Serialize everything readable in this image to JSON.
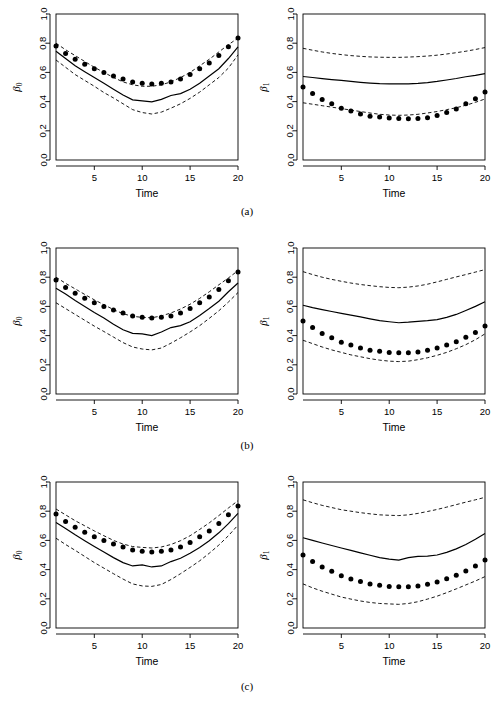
{
  "figure": {
    "rows": [
      {
        "caption": "(a)"
      },
      {
        "caption": "(b)"
      },
      {
        "caption": "(c)"
      }
    ]
  },
  "axis": {
    "xlabel": "Time",
    "xticks": [
      "5",
      "10",
      "15",
      "20"
    ],
    "xtick_values": [
      5,
      10,
      15,
      20
    ],
    "yticks": [
      "0.0",
      "0.2",
      "0.4",
      "0.6",
      "0.8",
      "1.0"
    ],
    "ytick_values": [
      0.0,
      0.2,
      0.4,
      0.6,
      0.8,
      1.0
    ],
    "ylabel_beta0": "β",
    "ylabel_beta0_sub": "0",
    "ylabel_beta1": "β",
    "ylabel_beta1_sub": "1"
  },
  "colors": {
    "line": "#000000",
    "dashed": "#000000",
    "point": "#000000",
    "axis": "#000000",
    "background": "#ffffff"
  },
  "chart_data": [
    {
      "type": "line",
      "panel": "a-beta0",
      "title": "",
      "xlabel": "Time",
      "ylabel": "β₀",
      "xlim": [
        1,
        20
      ],
      "ylim": [
        0.0,
        1.0
      ],
      "grid": false,
      "legend": "none",
      "x": [
        1,
        2,
        3,
        4,
        5,
        6,
        7,
        8,
        9,
        10,
        11,
        12,
        13,
        14,
        15,
        16,
        17,
        18,
        19,
        20
      ],
      "series": [
        {
          "name": "true (points)",
          "style": "points",
          "values": [
            0.78,
            0.73,
            0.69,
            0.655,
            0.625,
            0.6,
            0.575,
            0.555,
            0.535,
            0.525,
            0.52,
            0.525,
            0.535,
            0.555,
            0.585,
            0.625,
            0.665,
            0.715,
            0.775,
            0.835
          ]
        },
        {
          "name": "estimate (solid)",
          "style": "solid",
          "values": [
            0.745,
            0.695,
            0.645,
            0.605,
            0.565,
            0.525,
            0.485,
            0.445,
            0.412,
            0.405,
            0.398,
            0.415,
            0.442,
            0.455,
            0.485,
            0.525,
            0.575,
            0.625,
            0.695,
            0.775
          ]
        },
        {
          "name": "upper band (dashed)",
          "style": "dashed",
          "values": [
            0.8,
            0.755,
            0.715,
            0.675,
            0.635,
            0.6,
            0.565,
            0.535,
            0.515,
            0.505,
            0.505,
            0.515,
            0.535,
            0.565,
            0.6,
            0.645,
            0.69,
            0.74,
            0.79,
            0.835
          ]
        },
        {
          "name": "lower band (dashed)",
          "style": "dashed",
          "values": [
            0.685,
            0.635,
            0.585,
            0.545,
            0.505,
            0.462,
            0.425,
            0.385,
            0.345,
            0.325,
            0.315,
            0.328,
            0.355,
            0.385,
            0.422,
            0.465,
            0.515,
            0.565,
            0.63,
            0.72
          ]
        }
      ]
    },
    {
      "type": "line",
      "panel": "a-beta1",
      "title": "",
      "xlabel": "Time",
      "ylabel": "β₁",
      "xlim": [
        1,
        20
      ],
      "ylim": [
        0.0,
        1.0
      ],
      "grid": false,
      "legend": "none",
      "x": [
        1,
        2,
        3,
        4,
        5,
        6,
        7,
        8,
        9,
        10,
        11,
        12,
        13,
        14,
        15,
        16,
        17,
        18,
        19,
        20
      ],
      "series": [
        {
          "name": "true (points)",
          "style": "points",
          "values": [
            0.5,
            0.455,
            0.415,
            0.385,
            0.355,
            0.335,
            0.315,
            0.3,
            0.295,
            0.288,
            0.285,
            0.282,
            0.285,
            0.29,
            0.305,
            0.325,
            0.35,
            0.385,
            0.42,
            0.465
          ]
        },
        {
          "name": "estimate (solid)",
          "style": "solid",
          "values": [
            0.572,
            0.565,
            0.558,
            0.551,
            0.545,
            0.538,
            0.532,
            0.527,
            0.523,
            0.521,
            0.521,
            0.522,
            0.525,
            0.53,
            0.538,
            0.548,
            0.558,
            0.57,
            0.58,
            0.592
          ]
        },
        {
          "name": "upper band (dashed)",
          "style": "dashed",
          "values": [
            0.765,
            0.752,
            0.74,
            0.73,
            0.722,
            0.715,
            0.71,
            0.706,
            0.704,
            0.703,
            0.703,
            0.705,
            0.708,
            0.712,
            0.718,
            0.726,
            0.735,
            0.745,
            0.757,
            0.77
          ]
        },
        {
          "name": "lower band (dashed)",
          "style": "dashed",
          "values": [
            0.392,
            0.382,
            0.372,
            0.362,
            0.352,
            0.342,
            0.332,
            0.322,
            0.313,
            0.308,
            0.306,
            0.308,
            0.313,
            0.322,
            0.332,
            0.345,
            0.358,
            0.375,
            0.395,
            0.418
          ]
        }
      ]
    },
    {
      "type": "line",
      "panel": "b-beta0",
      "title": "",
      "xlabel": "Time",
      "ylabel": "β₀",
      "xlim": [
        1,
        20
      ],
      "ylim": [
        0.0,
        1.0
      ],
      "grid": false,
      "legend": "none",
      "x": [
        1,
        2,
        3,
        4,
        5,
        6,
        7,
        8,
        9,
        10,
        11,
        12,
        13,
        14,
        15,
        16,
        17,
        18,
        19,
        20
      ],
      "series": [
        {
          "name": "true (points)",
          "style": "points",
          "values": [
            0.78,
            0.73,
            0.69,
            0.655,
            0.625,
            0.6,
            0.575,
            0.555,
            0.535,
            0.525,
            0.52,
            0.525,
            0.535,
            0.555,
            0.585,
            0.625,
            0.665,
            0.715,
            0.775,
            0.835
          ]
        },
        {
          "name": "estimate (solid)",
          "style": "solid",
          "values": [
            0.725,
            0.685,
            0.64,
            0.6,
            0.558,
            0.52,
            0.478,
            0.44,
            0.415,
            0.412,
            0.4,
            0.425,
            0.455,
            0.468,
            0.495,
            0.538,
            0.585,
            0.635,
            0.7,
            0.76
          ]
        },
        {
          "name": "upper band (dashed)",
          "style": "dashed",
          "values": [
            0.8,
            0.758,
            0.72,
            0.682,
            0.645,
            0.612,
            0.578,
            0.55,
            0.532,
            0.525,
            0.522,
            0.535,
            0.555,
            0.582,
            0.615,
            0.655,
            0.7,
            0.748,
            0.795,
            0.845
          ]
        },
        {
          "name": "lower band (dashed)",
          "style": "dashed",
          "values": [
            0.625,
            0.585,
            0.545,
            0.505,
            0.465,
            0.428,
            0.39,
            0.352,
            0.322,
            0.308,
            0.302,
            0.315,
            0.348,
            0.385,
            0.425,
            0.468,
            0.518,
            0.57,
            0.63,
            0.695
          ]
        }
      ]
    },
    {
      "type": "line",
      "panel": "b-beta1",
      "title": "",
      "xlabel": "Time",
      "ylabel": "β₁",
      "xlim": [
        1,
        20
      ],
      "ylim": [
        0.0,
        1.0
      ],
      "grid": false,
      "legend": "none",
      "x": [
        1,
        2,
        3,
        4,
        5,
        6,
        7,
        8,
        9,
        10,
        11,
        12,
        13,
        14,
        15,
        16,
        17,
        18,
        19,
        20
      ],
      "series": [
        {
          "name": "true (points)",
          "style": "points",
          "values": [
            0.5,
            0.455,
            0.415,
            0.385,
            0.355,
            0.335,
            0.315,
            0.3,
            0.292,
            0.285,
            0.282,
            0.282,
            0.288,
            0.3,
            0.315,
            0.335,
            0.358,
            0.388,
            0.422,
            0.465
          ]
        },
        {
          "name": "estimate (solid)",
          "style": "solid",
          "values": [
            0.608,
            0.592,
            0.578,
            0.565,
            0.552,
            0.54,
            0.528,
            0.515,
            0.502,
            0.495,
            0.488,
            0.492,
            0.498,
            0.502,
            0.51,
            0.525,
            0.545,
            0.572,
            0.6,
            0.632
          ]
        },
        {
          "name": "upper band (dashed)",
          "style": "dashed",
          "values": [
            0.838,
            0.818,
            0.8,
            0.785,
            0.772,
            0.76,
            0.75,
            0.742,
            0.735,
            0.73,
            0.728,
            0.732,
            0.74,
            0.752,
            0.768,
            0.785,
            0.802,
            0.818,
            0.835,
            0.852
          ]
        },
        {
          "name": "lower band (dashed)",
          "style": "dashed",
          "values": [
            0.368,
            0.345,
            0.322,
            0.302,
            0.285,
            0.268,
            0.255,
            0.242,
            0.232,
            0.225,
            0.222,
            0.225,
            0.235,
            0.248,
            0.265,
            0.285,
            0.31,
            0.338,
            0.372,
            0.412
          ]
        }
      ]
    },
    {
      "type": "line",
      "panel": "c-beta0",
      "title": "",
      "xlabel": "Time",
      "ylabel": "β₀",
      "xlim": [
        1,
        20
      ],
      "ylim": [
        0.0,
        1.0
      ],
      "grid": false,
      "legend": "none",
      "x": [
        1,
        2,
        3,
        4,
        5,
        6,
        7,
        8,
        9,
        10,
        11,
        12,
        13,
        14,
        15,
        16,
        17,
        18,
        19,
        20
      ],
      "series": [
        {
          "name": "true (points)",
          "style": "points",
          "values": [
            0.78,
            0.73,
            0.69,
            0.655,
            0.625,
            0.6,
            0.575,
            0.555,
            0.535,
            0.525,
            0.52,
            0.525,
            0.535,
            0.555,
            0.585,
            0.625,
            0.665,
            0.715,
            0.775,
            0.835
          ]
        },
        {
          "name": "estimate (solid)",
          "style": "solid",
          "values": [
            0.722,
            0.682,
            0.638,
            0.598,
            0.558,
            0.52,
            0.482,
            0.448,
            0.425,
            0.432,
            0.418,
            0.425,
            0.455,
            0.478,
            0.512,
            0.552,
            0.598,
            0.652,
            0.715,
            0.785
          ]
        },
        {
          "name": "upper band (dashed)",
          "style": "dashed",
          "values": [
            0.815,
            0.775,
            0.735,
            0.7,
            0.665,
            0.632,
            0.6,
            0.575,
            0.558,
            0.552,
            0.548,
            0.555,
            0.572,
            0.598,
            0.632,
            0.675,
            0.72,
            0.77,
            0.822,
            0.872
          ]
        },
        {
          "name": "lower band (dashed)",
          "style": "dashed",
          "values": [
            0.615,
            0.572,
            0.532,
            0.49,
            0.448,
            0.41,
            0.372,
            0.335,
            0.302,
            0.288,
            0.285,
            0.298,
            0.332,
            0.372,
            0.415,
            0.46,
            0.512,
            0.568,
            0.632,
            0.705
          ]
        }
      ]
    },
    {
      "type": "line",
      "panel": "c-beta1",
      "title": "",
      "xlabel": "Time",
      "ylabel": "β₁",
      "xlim": [
        1,
        20
      ],
      "ylim": [
        0.0,
        1.0
      ],
      "grid": false,
      "legend": "none",
      "x": [
        1,
        2,
        3,
        4,
        5,
        6,
        7,
        8,
        9,
        10,
        11,
        12,
        13,
        14,
        15,
        16,
        17,
        18,
        19,
        20
      ],
      "series": [
        {
          "name": "true (points)",
          "style": "points",
          "values": [
            0.5,
            0.455,
            0.418,
            0.388,
            0.358,
            0.335,
            0.318,
            0.302,
            0.292,
            0.285,
            0.282,
            0.282,
            0.288,
            0.3,
            0.315,
            0.338,
            0.362,
            0.39,
            0.425,
            0.465
          ]
        },
        {
          "name": "estimate (solid)",
          "style": "solid",
          "values": [
            0.618,
            0.6,
            0.582,
            0.565,
            0.548,
            0.532,
            0.515,
            0.498,
            0.482,
            0.472,
            0.465,
            0.482,
            0.49,
            0.492,
            0.5,
            0.518,
            0.542,
            0.572,
            0.608,
            0.648
          ]
        },
        {
          "name": "upper band (dashed)",
          "style": "dashed",
          "values": [
            0.878,
            0.858,
            0.84,
            0.825,
            0.81,
            0.8,
            0.79,
            0.782,
            0.775,
            0.772,
            0.77,
            0.775,
            0.785,
            0.798,
            0.812,
            0.828,
            0.845,
            0.862,
            0.878,
            0.895
          ]
        },
        {
          "name": "lower band (dashed)",
          "style": "dashed",
          "values": [
            0.302,
            0.275,
            0.252,
            0.232,
            0.212,
            0.198,
            0.185,
            0.175,
            0.168,
            0.165,
            0.162,
            0.168,
            0.18,
            0.198,
            0.218,
            0.242,
            0.268,
            0.295,
            0.322,
            0.352
          ]
        }
      ]
    }
  ]
}
